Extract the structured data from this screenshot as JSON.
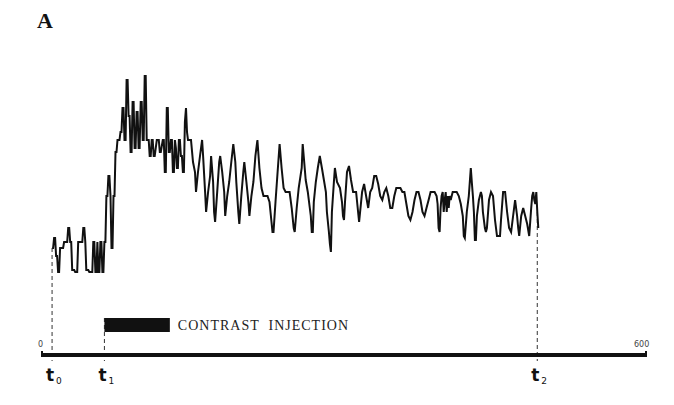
{
  "chart_data": {
    "type": "line",
    "panel_label": "A",
    "title": "",
    "xlabel": "",
    "ylabel": "",
    "xlim": [
      0,
      600
    ],
    "ylim": [
      0,
      100
    ],
    "grid": false,
    "x_tick_labels": [
      {
        "value": 0,
        "label": "0"
      },
      {
        "value": 600,
        "label": "600"
      }
    ],
    "time_markers": [
      {
        "name": "t0",
        "base": "t",
        "sub": "0",
        "value": 10
      },
      {
        "name": "t1",
        "base": "t",
        "sub": "1",
        "value": 62
      },
      {
        "name": "t2",
        "base": "t",
        "sub": "2",
        "value": 492
      }
    ],
    "annotation": {
      "label": "CONTRAST  INJECTION",
      "start": 62,
      "end": 127
    },
    "series": [
      {
        "name": "signal",
        "color": "#111111",
        "points": [
          [
            10,
            12
          ],
          [
            11,
            12
          ],
          [
            12,
            17
          ],
          [
            13,
            17
          ],
          [
            14,
            8
          ],
          [
            15,
            8
          ],
          [
            16,
            0
          ],
          [
            17,
            0
          ],
          [
            18,
            12
          ],
          [
            19,
            12
          ],
          [
            21,
            12
          ],
          [
            22,
            15
          ],
          [
            24,
            15
          ],
          [
            25,
            15
          ],
          [
            26,
            22
          ],
          [
            27,
            22
          ],
          [
            28,
            15
          ],
          [
            29,
            15
          ],
          [
            30,
            1
          ],
          [
            32,
            1
          ],
          [
            33,
            0
          ],
          [
            35,
            0
          ],
          [
            36,
            15
          ],
          [
            38,
            15
          ],
          [
            40,
            15
          ],
          [
            41,
            22
          ],
          [
            42,
            22
          ],
          [
            43,
            15
          ],
          [
            44,
            1
          ],
          [
            46,
            1
          ],
          [
            47,
            0
          ],
          [
            50,
            0
          ],
          [
            51,
            15
          ],
          [
            52,
            15
          ],
          [
            53,
            0
          ],
          [
            54,
            0
          ],
          [
            55,
            15
          ],
          [
            56,
            0
          ],
          [
            57,
            0
          ],
          [
            58,
            15
          ],
          [
            59,
            15
          ],
          [
            60,
            0
          ],
          [
            61,
            0
          ],
          [
            62,
            15
          ],
          [
            63,
            15
          ],
          [
            64,
            38
          ],
          [
            65,
            38
          ],
          [
            66,
            48
          ],
          [
            67,
            48
          ],
          [
            68,
            38
          ],
          [
            69,
            12
          ],
          [
            70,
            12
          ],
          [
            71,
            38
          ],
          [
            72,
            38
          ],
          [
            73,
            60
          ],
          [
            74,
            60
          ],
          [
            75,
            66
          ],
          [
            76,
            66
          ],
          [
            77,
            66
          ],
          [
            78,
            70
          ],
          [
            79,
            70
          ],
          [
            80,
            82
          ],
          [
            81,
            82
          ],
          [
            82,
            66
          ],
          [
            83,
            66
          ],
          [
            84,
            96
          ],
          [
            85,
            96
          ],
          [
            86,
            78
          ],
          [
            87,
            78
          ],
          [
            88,
            60
          ],
          [
            89,
            60
          ],
          [
            90,
            85
          ],
          [
            91,
            85
          ],
          [
            92,
            62
          ],
          [
            93,
            62
          ],
          [
            94,
            80
          ],
          [
            95,
            80
          ],
          [
            96,
            62
          ],
          [
            97,
            62
          ],
          [
            98,
            85
          ],
          [
            99,
            85
          ],
          [
            100,
            66
          ],
          [
            101,
            66
          ],
          [
            102,
            98
          ],
          [
            103,
            98
          ],
          [
            104,
            66
          ],
          [
            106,
            66
          ],
          [
            107,
            58
          ],
          [
            108,
            58
          ],
          [
            109,
            66
          ],
          [
            110,
            66
          ],
          [
            111,
            58
          ],
          [
            112,
            58
          ],
          [
            114,
            66
          ],
          [
            116,
            66
          ],
          [
            117,
            60
          ],
          [
            118,
            60
          ],
          [
            120,
            66
          ],
          [
            121,
            66
          ],
          [
            122,
            50
          ],
          [
            123,
            50
          ],
          [
            124,
            82
          ],
          [
            125,
            82
          ],
          [
            126,
            60
          ],
          [
            127,
            60
          ],
          [
            128,
            66
          ],
          [
            129,
            66
          ],
          [
            130,
            50
          ],
          [
            131,
            50
          ],
          [
            132,
            66
          ],
          [
            133,
            62
          ],
          [
            134,
            52
          ],
          [
            135,
            52
          ],
          [
            136,
            66
          ],
          [
            137,
            66
          ],
          [
            138,
            58
          ],
          [
            139,
            58
          ],
          [
            140,
            50
          ],
          [
            141,
            50
          ],
          [
            142,
            75
          ],
          [
            143,
            82
          ],
          [
            144,
            70
          ],
          [
            145,
            66
          ],
          [
            146,
            66
          ],
          [
            148,
            66
          ],
          [
            150,
            55
          ],
          [
            152,
            50
          ],
          [
            153,
            40
          ],
          [
            155,
            50
          ],
          [
            157,
            58
          ],
          [
            159,
            66
          ],
          [
            160,
            58
          ],
          [
            162,
            40
          ],
          [
            163,
            30
          ],
          [
            165,
            40
          ],
          [
            167,
            48
          ],
          [
            168,
            58
          ],
          [
            170,
            45
          ],
          [
            171,
            30
          ],
          [
            172,
            25
          ],
          [
            174,
            40
          ],
          [
            176,
            55
          ],
          [
            177,
            58
          ],
          [
            179,
            50
          ],
          [
            181,
            40
          ],
          [
            182,
            28
          ],
          [
            184,
            38
          ],
          [
            186,
            45
          ],
          [
            188,
            55
          ],
          [
            190,
            64
          ],
          [
            192,
            55
          ],
          [
            193,
            45
          ],
          [
            195,
            30
          ],
          [
            196,
            24
          ],
          [
            198,
            38
          ],
          [
            200,
            50
          ],
          [
            201,
            55
          ],
          [
            203,
            45
          ],
          [
            205,
            35
          ],
          [
            206,
            28
          ],
          [
            208,
            38
          ],
          [
            210,
            45
          ],
          [
            212,
            58
          ],
          [
            214,
            66
          ],
          [
            216,
            52
          ],
          [
            218,
            42
          ],
          [
            220,
            38
          ],
          [
            224,
            38
          ],
          [
            226,
            35
          ],
          [
            228,
            25
          ],
          [
            229,
            20
          ],
          [
            230,
            20
          ],
          [
            232,
            35
          ],
          [
            234,
            50
          ],
          [
            236,
            64
          ],
          [
            238,
            52
          ],
          [
            240,
            42
          ],
          [
            242,
            40
          ],
          [
            245,
            40
          ],
          [
            246,
            40
          ],
          [
            248,
            32
          ],
          [
            250,
            22
          ],
          [
            251,
            20
          ],
          [
            253,
            32
          ],
          [
            255,
            42
          ],
          [
            258,
            52
          ],
          [
            259,
            64
          ],
          [
            261,
            52
          ],
          [
            262,
            46
          ],
          [
            264,
            40
          ],
          [
            266,
            32
          ],
          [
            267,
            28
          ],
          [
            268,
            20
          ],
          [
            269,
            20
          ],
          [
            270,
            35
          ],
          [
            272,
            45
          ],
          [
            274,
            52
          ],
          [
            276,
            58
          ],
          [
            278,
            52
          ],
          [
            280,
            46
          ],
          [
            282,
            40
          ],
          [
            283,
            30
          ],
          [
            285,
            20
          ],
          [
            286,
            14
          ],
          [
            287,
            10
          ],
          [
            288,
            30
          ],
          [
            290,
            45
          ],
          [
            291,
            52
          ],
          [
            293,
            45
          ],
          [
            296,
            42
          ],
          [
            298,
            35
          ],
          [
            299,
            28
          ],
          [
            300,
            26
          ],
          [
            301,
            35
          ],
          [
            303,
            50
          ],
          [
            305,
            53
          ],
          [
            307,
            46
          ],
          [
            309,
            40
          ],
          [
            312,
            40
          ],
          [
            314,
            30
          ],
          [
            315,
            25
          ],
          [
            316,
            30
          ],
          [
            318,
            40
          ],
          [
            320,
            44
          ],
          [
            322,
            38
          ],
          [
            324,
            32
          ],
          [
            326,
            40
          ],
          [
            328,
            42
          ],
          [
            330,
            48
          ],
          [
            332,
            48
          ],
          [
            334,
            44
          ],
          [
            336,
            38
          ],
          [
            338,
            36
          ],
          [
            340,
            40
          ],
          [
            342,
            42
          ],
          [
            344,
            38
          ],
          [
            346,
            32
          ],
          [
            348,
            32
          ],
          [
            350,
            38
          ],
          [
            352,
            42
          ],
          [
            356,
            42
          ],
          [
            358,
            40
          ],
          [
            360,
            40
          ],
          [
            362,
            34
          ],
          [
            364,
            28
          ],
          [
            366,
            26
          ],
          [
            368,
            30
          ],
          [
            370,
            36
          ],
          [
            372,
            40
          ],
          [
            374,
            40
          ],
          [
            376,
            36
          ],
          [
            378,
            30
          ],
          [
            380,
            28
          ],
          [
            382,
            32
          ],
          [
            384,
            36
          ],
          [
            386,
            40
          ],
          [
            389,
            40
          ],
          [
            390,
            40
          ],
          [
            392,
            38
          ],
          [
            393,
            34
          ],
          [
            394,
            22
          ],
          [
            395,
            20
          ],
          [
            396,
            32
          ],
          [
            397,
            38
          ],
          [
            398,
            40
          ],
          [
            399,
            30
          ],
          [
            400,
            36
          ],
          [
            401,
            40
          ],
          [
            402,
            30
          ],
          [
            403,
            38
          ],
          [
            404,
            32
          ],
          [
            405,
            38
          ],
          [
            406,
            36
          ],
          [
            408,
            40
          ],
          [
            412,
            40
          ],
          [
            414,
            38
          ],
          [
            416,
            34
          ],
          [
            418,
            28
          ],
          [
            419,
            18
          ],
          [
            420,
            17
          ],
          [
            422,
            30
          ],
          [
            424,
            38
          ],
          [
            425,
            45
          ],
          [
            426,
            52
          ],
          [
            427,
            45
          ],
          [
            428,
            38
          ],
          [
            429,
            30
          ],
          [
            430,
            16
          ],
          [
            431,
            16
          ],
          [
            432,
            28
          ],
          [
            434,
            36
          ],
          [
            436,
            40
          ],
          [
            437,
            38
          ],
          [
            438,
            30
          ],
          [
            440,
            22
          ],
          [
            441,
            20
          ],
          [
            442,
            22
          ],
          [
            444,
            36
          ],
          [
            446,
            40
          ],
          [
            448,
            38
          ],
          [
            450,
            26
          ],
          [
            452,
            18
          ],
          [
            455,
            18
          ],
          [
            456,
            26
          ],
          [
            458,
            40
          ],
          [
            460,
            40
          ],
          [
            462,
            30
          ],
          [
            464,
            22
          ],
          [
            466,
            20
          ],
          [
            468,
            28
          ],
          [
            470,
            36
          ],
          [
            471,
            32
          ],
          [
            472,
            28
          ],
          [
            473,
            22
          ],
          [
            474,
            18
          ],
          [
            476,
            28
          ],
          [
            478,
            32
          ],
          [
            480,
            28
          ],
          [
            482,
            24
          ],
          [
            484,
            18
          ],
          [
            486,
            32
          ],
          [
            487,
            38
          ],
          [
            488,
            40
          ],
          [
            489,
            36
          ],
          [
            490,
            34
          ],
          [
            491,
            40
          ],
          [
            492,
            30
          ],
          [
            493,
            22
          ]
        ]
      }
    ]
  }
}
